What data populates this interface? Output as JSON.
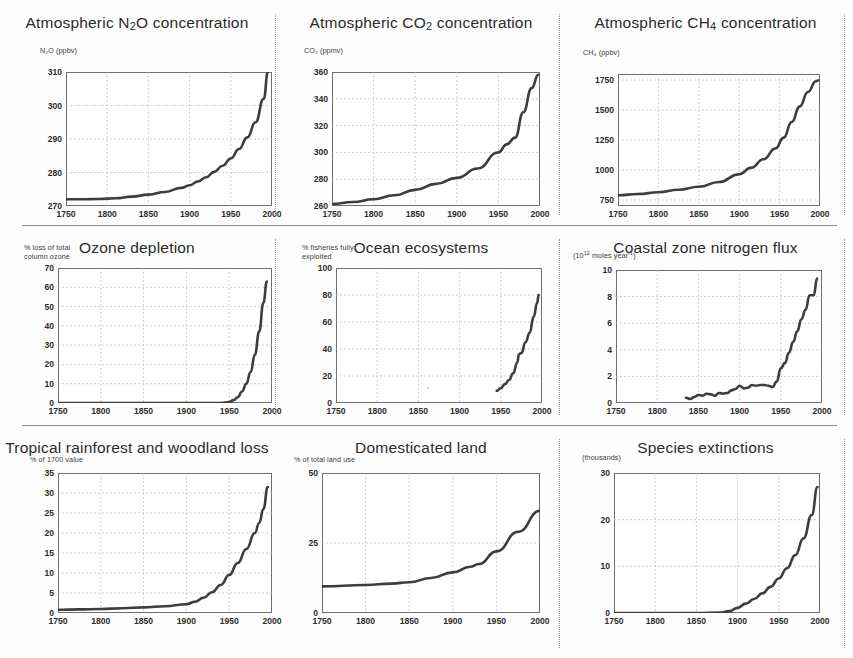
{
  "figure": {
    "layout": "3x3 grid of time-series line charts",
    "shared_xlabel_ticks": [
      "1750",
      "1800",
      "1850",
      "1900",
      "1950",
      "2000"
    ],
    "xlim": [
      1750,
      2000
    ]
  },
  "chart_data": [
    {
      "id": "n2o",
      "type": "line",
      "title": "Atmospheric N₂O concentration",
      "title_parts": {
        "pre": "Atmospheric N",
        "sub": "2",
        "post": "O concentration"
      },
      "ylabel": "N₂O (ppbv)",
      "xlabel": "",
      "xlim": [
        1750,
        2000
      ],
      "ylim": [
        270,
        310
      ],
      "yticks": [
        270,
        280,
        290,
        300,
        310
      ],
      "xticks": [
        1750,
        1800,
        1850,
        1900,
        1950,
        2000
      ],
      "grid": true,
      "x": [
        1750,
        1770,
        1790,
        1810,
        1830,
        1850,
        1870,
        1890,
        1900,
        1910,
        1920,
        1930,
        1940,
        1950,
        1960,
        1970,
        1980,
        1990,
        1995
      ],
      "values": [
        272.0,
        272.0,
        272.1,
        272.3,
        272.8,
        273.4,
        274.2,
        275.4,
        276.2,
        277.3,
        278.6,
        280.2,
        282.0,
        284.2,
        287.0,
        290.5,
        295.0,
        302.0,
        310.0
      ]
    },
    {
      "id": "co2",
      "type": "line",
      "title": "Atmospheric CO₂ concentration",
      "title_parts": {
        "pre": "Atmospheric CO",
        "sub": "2",
        "post": " concentration"
      },
      "ylabel": "CO₂ (ppmv)",
      "xlabel": "",
      "xlim": [
        1750,
        2000
      ],
      "ylim": [
        260,
        360
      ],
      "yticks": [
        260,
        280,
        300,
        320,
        340,
        360
      ],
      "xticks": [
        1750,
        1800,
        1850,
        1900,
        1950,
        2000
      ],
      "grid": true,
      "x": [
        1750,
        1775,
        1800,
        1825,
        1850,
        1875,
        1900,
        1925,
        1950,
        1960,
        1970,
        1980,
        1990,
        1998
      ],
      "values": [
        261.5,
        263.0,
        265.0,
        268.0,
        272.0,
        276.5,
        281.0,
        288.0,
        300.0,
        306.0,
        311.0,
        330.0,
        348.0,
        358.0
      ]
    },
    {
      "id": "ch4",
      "type": "line",
      "title": "Atmospheric CH₄ concentration",
      "title_parts": {
        "pre": "Atmospheric CH",
        "sub": "4",
        "post": " concentration"
      },
      "ylabel": "CH₄ (ppbv)",
      "xlabel": "",
      "xlim": [
        1750,
        2000
      ],
      "ylim": [
        700,
        1800
      ],
      "yticks": [
        750,
        1000,
        1250,
        1500,
        1750
      ],
      "xticks": [
        1750,
        1800,
        1850,
        1900,
        1950,
        2000
      ],
      "grid": true,
      "x": [
        1750,
        1775,
        1800,
        1825,
        1850,
        1875,
        1900,
        1915,
        1930,
        1945,
        1955,
        1965,
        1975,
        1985,
        1995,
        1998
      ],
      "values": [
        790,
        800,
        815,
        835,
        860,
        900,
        965,
        1020,
        1090,
        1180,
        1270,
        1400,
        1530,
        1650,
        1740,
        1748
      ]
    },
    {
      "id": "ozone",
      "type": "line",
      "title": "Ozone depletion",
      "ylabel": "% loss of total\ncolumn ozone",
      "xlabel": "",
      "xlim": [
        1750,
        2000
      ],
      "ylim": [
        0,
        70
      ],
      "yticks": [
        0,
        10,
        20,
        30,
        40,
        50,
        60,
        70
      ],
      "xticks": [
        1750,
        1800,
        1850,
        1900,
        1950,
        2000
      ],
      "grid": true,
      "x": [
        1750,
        1900,
        1940,
        1950,
        1955,
        1960,
        1965,
        1970,
        1975,
        1980,
        1985,
        1990,
        1994
      ],
      "values": [
        0,
        0,
        0,
        0.5,
        1.5,
        3,
        6,
        10,
        16,
        25,
        37,
        52,
        63
      ]
    },
    {
      "id": "ocean",
      "type": "line",
      "title": "Ocean ecosystems",
      "ylabel": "% fisheries fully\n   exploited",
      "xlabel": "",
      "xlim": [
        1750,
        2000
      ],
      "ylim": [
        0,
        100
      ],
      "yticks": [
        0,
        20,
        40,
        60,
        80,
        100
      ],
      "xticks": [
        1750,
        1800,
        1850,
        1900,
        1950,
        2000
      ],
      "grid": true,
      "x": [
        1945,
        1950,
        1955,
        1960,
        1965,
        1970,
        1972,
        1975,
        1980,
        1985,
        1990,
        1994,
        1996
      ],
      "values": [
        9,
        11,
        14,
        17,
        22,
        30,
        36,
        37,
        45,
        52,
        64,
        74,
        80
      ]
    },
    {
      "id": "nflux",
      "type": "line",
      "title": "Coastal zone nitrogen flux",
      "ylabel": "(10¹² moles year⁻¹)",
      "xlabel": "",
      "xlim": [
        1750,
        2000
      ],
      "ylim": [
        0,
        10
      ],
      "yticks": [
        0,
        2,
        4,
        6,
        8,
        10
      ],
      "xticks": [
        1750,
        1800,
        1850,
        1900,
        1950,
        2000
      ],
      "grid": true,
      "x": [
        1835,
        1840,
        1845,
        1850,
        1855,
        1860,
        1865,
        1870,
        1875,
        1880,
        1885,
        1890,
        1895,
        1900,
        1905,
        1910,
        1915,
        1920,
        1925,
        1930,
        1935,
        1940,
        1945,
        1950,
        1955,
        1960,
        1965,
        1970,
        1975,
        1980,
        1985,
        1990,
        1994
      ],
      "values": [
        0.4,
        0.3,
        0.45,
        0.6,
        0.55,
        0.7,
        0.65,
        0.55,
        0.75,
        0.7,
        0.75,
        0.95,
        1.05,
        1.3,
        1.1,
        1.15,
        1.35,
        1.3,
        1.35,
        1.35,
        1.3,
        1.2,
        1.6,
        2.6,
        3.0,
        3.8,
        4.6,
        5.4,
        6.3,
        7.0,
        8.1,
        8.1,
        9.35
      ]
    },
    {
      "id": "forest",
      "type": "line",
      "title": "Tropical rainforest and woodland loss",
      "ylabel": "% of 1700 value",
      "xlabel": "",
      "xlim": [
        1750,
        2000
      ],
      "ylim": [
        0,
        35
      ],
      "yticks": [
        0,
        5,
        10,
        15,
        20,
        25,
        30,
        35
      ],
      "xticks": [
        1750,
        1800,
        1850,
        1900,
        1950,
        2000
      ],
      "grid": true,
      "x": [
        1750,
        1775,
        1800,
        1825,
        1850,
        1875,
        1900,
        1910,
        1920,
        1930,
        1940,
        1950,
        1960,
        1970,
        1980,
        1985,
        1990,
        1995
      ],
      "values": [
        0.8,
        0.9,
        1.0,
        1.2,
        1.4,
        1.7,
        2.2,
        2.8,
        3.8,
        5.2,
        7.0,
        9.5,
        12.5,
        16.0,
        20.0,
        22.5,
        26.0,
        31.5
      ]
    },
    {
      "id": "land",
      "type": "line",
      "title": "Domesticated land",
      "ylabel": "% of total land use",
      "xlabel": "",
      "xlim": [
        1750,
        2000
      ],
      "ylim": [
        0,
        50
      ],
      "yticks": [
        0,
        25,
        50
      ],
      "xticks": [
        1750,
        1800,
        1850,
        1900,
        1950,
        2000
      ],
      "grid": true,
      "x": [
        1750,
        1800,
        1830,
        1850,
        1875,
        1900,
        1920,
        1930,
        1950,
        1975,
        2000
      ],
      "values": [
        9.5,
        10.0,
        10.5,
        11.0,
        12.5,
        14.5,
        16.5,
        17.5,
        22.0,
        29.0,
        36.5
      ]
    },
    {
      "id": "extinctions",
      "type": "line",
      "title": "Species extinctions",
      "ylabel": "(thousands)",
      "xlabel": "",
      "xlim": [
        1750,
        2000
      ],
      "ylim": [
        0,
        30
      ],
      "yticks": [
        0,
        10,
        20,
        30
      ],
      "xticks": [
        1750,
        1800,
        1850,
        1900,
        1950,
        2000
      ],
      "grid": true,
      "x": [
        1750,
        1850,
        1880,
        1890,
        1900,
        1910,
        1920,
        1930,
        1940,
        1950,
        1960,
        1970,
        1980,
        1990,
        1997
      ],
      "values": [
        0,
        0,
        0.1,
        0.4,
        1.1,
        2.0,
        3.0,
        4.2,
        5.6,
        7.4,
        9.6,
        12.4,
        16.0,
        21.0,
        27.0
      ]
    }
  ],
  "colors": {
    "curve": "#3d3d3d",
    "frame": "#6f6f6f",
    "grid": "#b9b9c8",
    "text": "#2b2b2b",
    "background": "#fdfdfd"
  }
}
